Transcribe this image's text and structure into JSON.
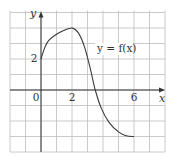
{
  "chart_data": {
    "type": "line",
    "title": "",
    "xlabel": "x",
    "ylabel": "y",
    "xlim": [
      -2,
      8
    ],
    "ylim": [
      -4,
      5
    ],
    "grid": true,
    "grid_step": 1,
    "x_ticks_labeled": [
      {
        "value": 0,
        "label": "0"
      },
      {
        "value": 2,
        "label": "2"
      },
      {
        "value": 6,
        "label": "6"
      }
    ],
    "y_ticks_labeled": [
      {
        "value": 2,
        "label": "2"
      }
    ],
    "series": [
      {
        "name": "y = f(x)",
        "points": [
          [
            0,
            2
          ],
          [
            0.25,
            2.75
          ],
          [
            0.5,
            3.2
          ],
          [
            1,
            3.6
          ],
          [
            1.5,
            3.85
          ],
          [
            2,
            4
          ],
          [
            2.4,
            3.7
          ],
          [
            2.8,
            2.8
          ],
          [
            3.2,
            1.3
          ],
          [
            3.5,
            0
          ],
          [
            3.9,
            -1.2
          ],
          [
            4.4,
            -2.1
          ],
          [
            5,
            -2.7
          ],
          [
            5.5,
            -2.95
          ],
          [
            6,
            -3
          ]
        ]
      }
    ],
    "annotations": [
      {
        "text": "y = f(x)",
        "x": 5.2,
        "y": 2.4
      }
    ],
    "legend": "none"
  },
  "labels": {
    "x_axis": "x",
    "y_axis": "y",
    "curve": "y = f(x)",
    "tick_0": "0",
    "tick_x2": "2",
    "tick_x6": "6",
    "tick_y2": "2"
  },
  "colors": {
    "grid": "#bdbdbd",
    "axis": "#333333",
    "curve": "#3a3a3a",
    "background": "#ffffff"
  }
}
